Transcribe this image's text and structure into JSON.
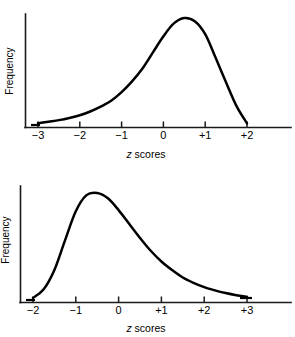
{
  "figure": {
    "background_color": "#ffffff",
    "line_color": "#000000",
    "axis_color": "#1a1a1a"
  },
  "chart_data": [
    {
      "type": "line",
      "id": "negatively-skewed-distribution",
      "title": "",
      "shape": "negatively skewed",
      "xlabel_prefix": "z",
      "xlabel_suffix": " scores",
      "xlabel": "z scores",
      "ylabel": "Frequency",
      "grid": false,
      "legend": "none",
      "xlim": [
        -3,
        2
      ],
      "ylim": [
        0,
        1
      ],
      "xticks": [
        -3,
        -2,
        -1,
        0,
        1,
        2
      ],
      "xticklabels": [
        "−3",
        "−2",
        "−1",
        "0",
        "+1",
        "+2"
      ],
      "yticks": [],
      "yticklabels": [],
      "peak_x": 0.55,
      "x": [
        -3.0,
        -2.75,
        -2.5,
        -2.25,
        -2.0,
        -1.75,
        -1.5,
        -1.25,
        -1.0,
        -0.75,
        -0.5,
        -0.25,
        0.0,
        0.25,
        0.5,
        0.75,
        1.0,
        1.25,
        1.5,
        1.75,
        2.0
      ],
      "y": [
        0.02,
        0.035,
        0.05,
        0.07,
        0.095,
        0.13,
        0.175,
        0.23,
        0.31,
        0.41,
        0.53,
        0.68,
        0.83,
        0.95,
        1.0,
        0.97,
        0.85,
        0.63,
        0.4,
        0.18,
        0.02
      ]
    },
    {
      "type": "line",
      "id": "positively-skewed-distribution",
      "title": "",
      "shape": "positively skewed",
      "xlabel_prefix": "z",
      "xlabel_suffix": " scores",
      "xlabel": "z scores",
      "ylabel": "Frequency",
      "grid": false,
      "legend": "none",
      "xlim": [
        -2,
        3
      ],
      "ylim": [
        0,
        1
      ],
      "xticks": [
        -2,
        -1,
        0,
        1,
        2,
        3
      ],
      "xticklabels": [
        "−2",
        "−1",
        "0",
        "+1",
        "+2",
        "+3"
      ],
      "yticks": [],
      "yticklabels": [],
      "peak_x": -0.45,
      "x": [
        -2.0,
        -1.75,
        -1.5,
        -1.25,
        -1.0,
        -0.75,
        -0.5,
        -0.25,
        0.0,
        0.25,
        0.5,
        0.75,
        1.0,
        1.25,
        1.5,
        1.75,
        2.0,
        2.25,
        2.5,
        2.75,
        3.0
      ],
      "y": [
        0.02,
        0.1,
        0.28,
        0.56,
        0.83,
        0.98,
        1.0,
        0.95,
        0.84,
        0.71,
        0.58,
        0.46,
        0.36,
        0.28,
        0.21,
        0.16,
        0.12,
        0.09,
        0.065,
        0.045,
        0.03
      ]
    }
  ]
}
